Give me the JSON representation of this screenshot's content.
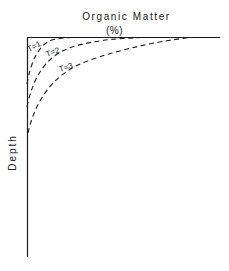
{
  "diagram": {
    "title": "Organic Matter",
    "unit": "(%)",
    "y_axis_label": "Depth",
    "x_axis_position": "top",
    "curves": [
      {
        "label": "T=1",
        "style": "dashed"
      },
      {
        "label": "T=2",
        "style": "dashed"
      },
      {
        "label": "T=3",
        "style": "dashed"
      }
    ]
  }
}
